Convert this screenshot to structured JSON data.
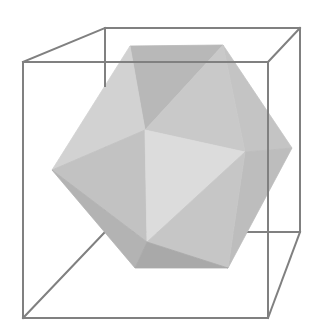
{
  "figure": {
    "title": "Icosahedron inscribed in a cube",
    "background": "#ffffff"
  },
  "cube": {
    "edge_color": "#808080",
    "edge_width": 2,
    "vertices": {
      "front_top_left": [
        23,
        62
      ],
      "front_top_right": [
        268,
        62
      ],
      "front_bottom_right": [
        268,
        318
      ],
      "front_bottom_left": [
        23,
        318
      ],
      "back_top_left": [
        105,
        28
      ],
      "back_top_right": [
        300,
        28
      ],
      "back_bottom_right": [
        300,
        232
      ],
      "back_bottom_left": [
        105,
        232
      ]
    }
  },
  "icosahedron": {
    "vertices": {
      "A": [
        130,
        46
      ],
      "B": [
        223,
        45
      ],
      "C": [
        145,
        130
      ],
      "D": [
        292,
        148
      ],
      "E": [
        52,
        170
      ],
      "F": [
        147,
        242
      ],
      "G": [
        135,
        268
      ],
      "H": [
        228,
        268
      ],
      "I": [
        245,
        152
      ]
    },
    "faces": [
      {
        "name": "top-back",
        "pts": [
          "A",
          "B",
          "C"
        ],
        "fill": "#b8b8b8"
      },
      {
        "name": "upper-left",
        "pts": [
          "A",
          "C",
          "E"
        ],
        "fill": "#d2d2d2"
      },
      {
        "name": "upper-right",
        "pts": [
          "B",
          "D",
          "I"
        ],
        "fill": "#c4c4c4"
      },
      {
        "name": "upper-right-inner",
        "pts": [
          "B",
          "I",
          "C"
        ],
        "fill": "#c9c9c9"
      },
      {
        "name": "center-left",
        "pts": [
          "E",
          "C",
          "F"
        ],
        "fill": "#c2c2c2"
      },
      {
        "name": "center-front",
        "pts": [
          "C",
          "I",
          "F"
        ],
        "fill": "#dcdcdc"
      },
      {
        "name": "right-lower",
        "pts": [
          "I",
          "D",
          "H"
        ],
        "fill": "#bdbdbd"
      },
      {
        "name": "front-lower",
        "pts": [
          "F",
          "I",
          "H"
        ],
        "fill": "#c6c6c6"
      },
      {
        "name": "left-lower",
        "pts": [
          "E",
          "F",
          "G"
        ],
        "fill": "#b3b3b3"
      },
      {
        "name": "bottom",
        "pts": [
          "G",
          "F",
          "H"
        ],
        "fill": "#a9a9a9"
      }
    ]
  }
}
